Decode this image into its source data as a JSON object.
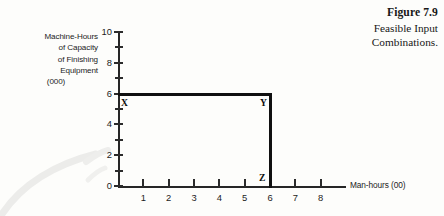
{
  "figure": {
    "caption_title": "Figure 7.9",
    "caption_line1": "Feasible Input",
    "caption_line2": "Combinations."
  },
  "y_axis": {
    "title_lines": [
      "Machine-Hours",
      "of Capacity",
      "of Finishing",
      "Equipment",
      "(000)"
    ],
    "tick_labels": [
      "0",
      "2",
      "4",
      "6",
      "8",
      "10"
    ],
    "major_ticks": [
      0,
      2,
      4,
      6,
      8,
      10
    ],
    "minor_ticks": [
      1,
      3,
      5,
      7,
      9
    ],
    "range": [
      0,
      10
    ]
  },
  "x_axis": {
    "title": "Man-hours (00)",
    "tick_labels": [
      "1",
      "2",
      "3",
      "4",
      "5",
      "6",
      "7",
      "8"
    ],
    "major_ticks": [
      1,
      2,
      3,
      4,
      5,
      6,
      7,
      8
    ],
    "range": [
      0,
      9
    ]
  },
  "point_labels": {
    "x": "X",
    "y": "Y",
    "z": "Z"
  },
  "colors": {
    "background": "#fdfdfb",
    "axis": "#262626",
    "boundary": "#101010",
    "text": "#1a1a1a",
    "smudge": "#ebebeb"
  },
  "chart_data": {
    "type": "line",
    "title": "Feasible Input Combinations.",
    "xlabel": "Man-hours (00)",
    "ylabel": "Machine-Hours of Capacity of Finishing Equipment (000)",
    "xlim": [
      0,
      9
    ],
    "ylim": [
      0,
      10
    ],
    "grid": false,
    "legend": null,
    "x_ticks": [
      1,
      2,
      3,
      4,
      5,
      6,
      7,
      8
    ],
    "y_ticks": [
      0,
      2,
      4,
      6,
      8,
      10
    ],
    "y_minor_ticks": [
      1,
      3,
      5,
      7,
      9
    ],
    "series": [
      {
        "name": "Feasible region boundary",
        "kind": "step-corner",
        "points": [
          {
            "label": "X",
            "x": 0,
            "y": 6
          },
          {
            "label": "Y",
            "x": 6,
            "y": 6
          },
          {
            "label": "Z",
            "x": 6,
            "y": 0
          }
        ]
      }
    ],
    "annotations": [
      {
        "text": "X",
        "x": 0,
        "y": 6,
        "placement": "below-right"
      },
      {
        "text": "Y",
        "x": 6,
        "y": 6,
        "placement": "below-left"
      },
      {
        "text": "Z",
        "x": 6,
        "y": 0,
        "placement": "above-left"
      }
    ]
  }
}
